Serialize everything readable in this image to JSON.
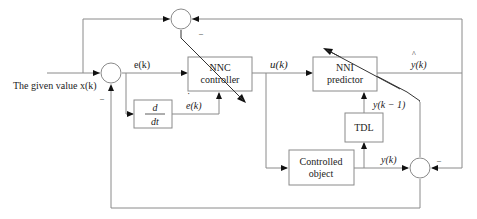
{
  "diagram": {
    "type": "control-system block diagram",
    "input_label": "The given value x(k)",
    "blocks": {
      "nnc": {
        "line1": "NNC",
        "line2": "controller"
      },
      "nni": {
        "line1": "NNI",
        "line2": "predictor"
      },
      "derivative": {
        "numerator": "d",
        "denominator": "dt"
      },
      "tdl": {
        "label": "TDL"
      },
      "plant": {
        "line1": "Controlled",
        "line2": "object"
      }
    },
    "signals": {
      "error": "e(k)",
      "error_dot": "e(k)",
      "error_dot_accent": "˙",
      "control": "u(k)",
      "prediction": "y(k)",
      "prediction_hat": "^",
      "output": "y(k)",
      "delayed_output": "y(k − 1)"
    },
    "signs": {
      "top_sum_minus": "–",
      "left_sum_minus": "–",
      "right_sum_minus": "–"
    },
    "colors": {
      "line": "#8a8a8a",
      "arrow": "#111111",
      "text": "#222222"
    }
  }
}
